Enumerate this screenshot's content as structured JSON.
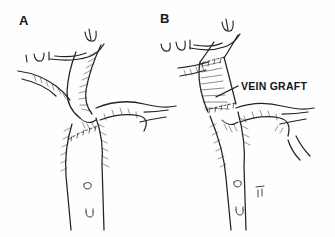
{
  "figure": {
    "kind": "medical-line-illustration",
    "background_color": "#fefefe",
    "ink_color": "#232323",
    "hatch_color": "#3a3a3a",
    "width": 335,
    "height": 237
  },
  "panels": [
    {
      "id": "A",
      "label": "A",
      "description": "Bifurcation after endarterectomy with primary closure suture line"
    },
    {
      "id": "B",
      "label": "B",
      "description": "Bifurcation reconstructed with interposition vein graft"
    }
  ],
  "annotations": [
    {
      "id": "vein-graft",
      "text": "VEIN GRAFT",
      "leader": true,
      "panel": "B"
    }
  ],
  "icons": {
    "leader_line": "leader-line-icon",
    "clip": "vessel-clip-icon",
    "suture": "suture-line-icon",
    "orifice": "branch-orifice-icon"
  }
}
